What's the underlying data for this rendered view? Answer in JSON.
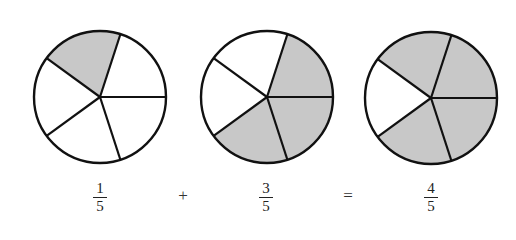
{
  "diagram": {
    "colors": {
      "shade": "#c8c8c8",
      "outline": "#111111",
      "background": "#ffffff"
    },
    "circles": [
      {
        "name": "one-fifth-circle",
        "cx": 100,
        "cy": 97,
        "r": 66,
        "parts": 5,
        "shaded_sectors": [
          3
        ]
      },
      {
        "name": "three-fifths-circle",
        "cx": 267,
        "cy": 97,
        "r": 66,
        "parts": 5,
        "shaded_sectors": [
          0,
          1,
          4
        ]
      },
      {
        "name": "four-fifths-circle",
        "cx": 431,
        "cy": 98,
        "r": 66,
        "parts": 5,
        "shaded_sectors": [
          0,
          1,
          3,
          4
        ]
      }
    ],
    "equation": {
      "term1": {
        "numerator": "1",
        "denominator": "5"
      },
      "plus": "+",
      "term2": {
        "numerator": "3",
        "denominator": "5"
      },
      "equals": "=",
      "result": {
        "numerator": "4",
        "denominator": "5"
      }
    }
  }
}
